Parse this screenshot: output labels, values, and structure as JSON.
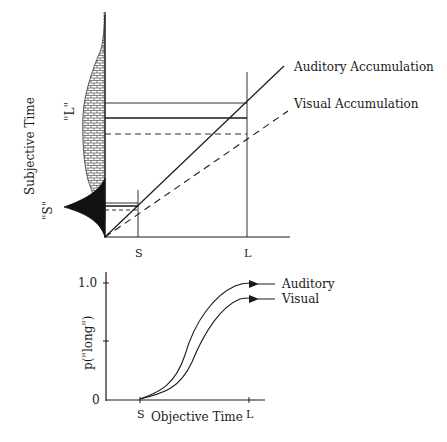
{
  "top_panel": {
    "y_axis_label": "Subjective Time",
    "x_ticks": [
      "S",
      "L"
    ],
    "dist_labels": {
      "short": "\"S\"",
      "long": "\"L\""
    },
    "legend": {
      "auditory": "Auditory Accumulation",
      "visual": "Visual Accumulation"
    },
    "line_styles": {
      "auditory": "solid",
      "visual": "dashed"
    }
  },
  "bottom_panel": {
    "y_axis_label": "p(\"long\")",
    "x_axis_label": "Objective Time",
    "y_ticks": [
      "1.0",
      "0"
    ],
    "x_ticks": [
      "S",
      "L"
    ],
    "legend": {
      "auditory": "Auditory",
      "visual": "Visual"
    }
  },
  "colors": {
    "ink": "#1a1a1a",
    "background": "#ffffff"
  }
}
